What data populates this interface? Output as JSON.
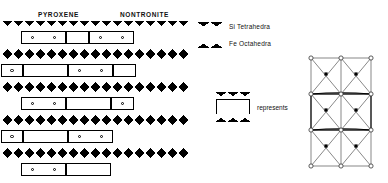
{
  "figure": {
    "kind": "mineral-structure-diagram",
    "labels": {
      "pyroxene": "PYROXENE",
      "nontronite": "NONTRONITE"
    },
    "legend": {
      "items": [
        {
          "symbol": "down-triangle-band",
          "label": "Si Tetrahedra"
        },
        {
          "symbol": "up-triangle-band",
          "label": "Fe Octahedra"
        }
      ]
    },
    "represents": {
      "symbol": "octahedral-box-between-tetrahedral-sheets",
      "label": "represents"
    },
    "colors": {
      "ink": "#000000",
      "paper": "#ffffff",
      "lattice_line": "#555555"
    },
    "bands": [
      {
        "row": 0,
        "type": "tetrahedral-down",
        "top": 0,
        "left": 2,
        "width": 188
      },
      {
        "row": 1,
        "type": "octahedral-gap",
        "top": 11,
        "left": 2,
        "width": 188
      },
      {
        "row": 2,
        "type": "tetrahedral-up",
        "top": 22,
        "left": 2,
        "width": 188
      },
      {
        "row": 3,
        "type": "tetrahedral-down",
        "top": 33,
        "left": 2,
        "width": 188
      },
      {
        "row": 4,
        "type": "octahedral-gap",
        "top": 44,
        "left": 2,
        "width": 188
      },
      {
        "row": 5,
        "type": "tetrahedral-up",
        "top": 55,
        "left": 2,
        "width": 188
      },
      {
        "row": 6,
        "type": "tetrahedral-down",
        "top": 66,
        "left": 2,
        "width": 188
      },
      {
        "row": 7,
        "type": "octahedral-gap",
        "top": 77,
        "left": 2,
        "width": 188
      },
      {
        "row": 8,
        "type": "tetrahedral-up",
        "top": 88,
        "left": 2,
        "width": 188
      },
      {
        "row": 9,
        "type": "tetrahedral-down",
        "top": 99,
        "left": 2,
        "width": 188
      },
      {
        "row": 10,
        "type": "octahedral-gap",
        "top": 110,
        "left": 2,
        "width": 188
      },
      {
        "row": 11,
        "type": "tetrahedral-up",
        "top": 121,
        "left": 2,
        "width": 188
      },
      {
        "row": 12,
        "type": "tetrahedral-down",
        "top": 132,
        "left": 2,
        "width": 188
      },
      {
        "row": 13,
        "type": "octahedral-gap",
        "top": 143,
        "left": 2,
        "width": 188
      }
    ],
    "octahedral_boxes": [
      {
        "left": 21,
        "top": 10,
        "width": 45,
        "height": 13,
        "circles": 2
      },
      {
        "left": 66,
        "top": 10,
        "width": 23,
        "height": 13,
        "circles": 0
      },
      {
        "left": 89,
        "top": 10,
        "width": 45,
        "height": 13,
        "circles": 2
      },
      {
        "left": 1,
        "top": 43,
        "width": 22,
        "height": 13,
        "circles": 1
      },
      {
        "left": 23,
        "top": 43,
        "width": 45,
        "height": 13,
        "circles": 0
      },
      {
        "left": 68,
        "top": 43,
        "width": 45,
        "height": 13,
        "circles": 2
      },
      {
        "left": 113,
        "top": 43,
        "width": 23,
        "height": 13,
        "circles": 0
      },
      {
        "left": 21,
        "top": 76,
        "width": 45,
        "height": 13,
        "circles": 2
      },
      {
        "left": 66,
        "top": 76,
        "width": 45,
        "height": 13,
        "circles": 0
      },
      {
        "left": 111,
        "top": 76,
        "width": 23,
        "height": 13,
        "circles": 1
      },
      {
        "left": 1,
        "top": 109,
        "width": 22,
        "height": 13,
        "circles": 1
      },
      {
        "left": 23,
        "top": 109,
        "width": 45,
        "height": 13,
        "circles": 0
      },
      {
        "left": 68,
        "top": 109,
        "width": 45,
        "height": 13,
        "circles": 2
      },
      {
        "left": 21,
        "top": 142,
        "width": 45,
        "height": 13,
        "circles": 2
      },
      {
        "left": 66,
        "top": 142,
        "width": 45,
        "height": 13,
        "circles": 0
      }
    ],
    "lattice": {
      "open_vertices": [
        [
          10,
          6
        ],
        [
          40,
          6
        ],
        [
          70,
          6
        ],
        [
          10,
          42
        ],
        [
          40,
          42
        ],
        [
          70,
          42
        ],
        [
          10,
          78
        ],
        [
          40,
          78
        ],
        [
          70,
          78
        ],
        [
          10,
          114
        ],
        [
          40,
          114
        ],
        [
          70,
          114
        ]
      ],
      "filled_atoms": [
        [
          25,
          22
        ],
        [
          55,
          22
        ],
        [
          25,
          58
        ],
        [
          55,
          58
        ],
        [
          25,
          94
        ],
        [
          55,
          94
        ]
      ],
      "highlight_rect": {
        "x": 10,
        "y": 42,
        "w": 60,
        "h": 36
      }
    }
  }
}
